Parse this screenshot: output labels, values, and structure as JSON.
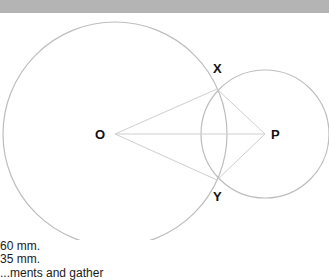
{
  "diagram": {
    "points": {
      "O": {
        "label": "O",
        "x": 115,
        "y": 134
      },
      "P": {
        "label": "P",
        "x": 265,
        "y": 134
      },
      "X": {
        "label": "X",
        "x": 217,
        "y": 89
      },
      "Y": {
        "label": "Y",
        "x": 217,
        "y": 180
      }
    },
    "circles": [
      {
        "name": "circle-O",
        "cx": 115,
        "cy": 134,
        "r": 112
      },
      {
        "name": "circle-P",
        "cx": 265,
        "cy": 134,
        "r": 64
      }
    ],
    "segments": [
      [
        "O",
        "X"
      ],
      [
        "O",
        "P"
      ],
      [
        "O",
        "Y"
      ],
      [
        "X",
        "P"
      ],
      [
        "Y",
        "P"
      ]
    ],
    "colors": {
      "circle": "#bdbdbd",
      "segment": "#cfcfcf",
      "topbar": "#b4b4b4"
    }
  },
  "captions": {
    "line1": "60 mm.",
    "line2": "35 mm.",
    "line3": "...ments and gather"
  }
}
